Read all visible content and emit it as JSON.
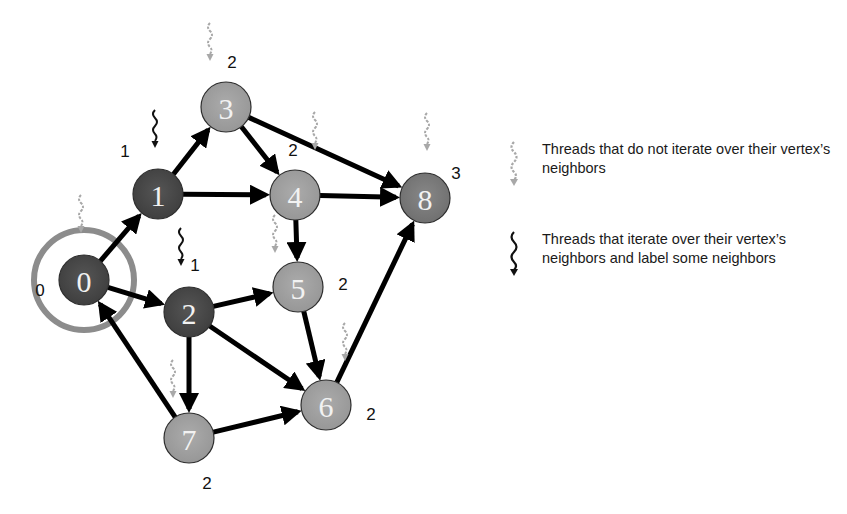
{
  "diagram": {
    "type": "directed-graph-bfs",
    "source_node": "0",
    "colors": {
      "visited_dark": "#4b4b4b",
      "frontier_light": "#a3a3a3",
      "node_8": "#7e7e7e",
      "source_ring": "#8c8c8c",
      "edge": "#000000",
      "idle_thread": "#a8a8a8",
      "active_thread": "#111111"
    },
    "nodes": [
      {
        "id": "0",
        "label": "0",
        "level": "0",
        "x": 84,
        "y": 280,
        "shade": "dark",
        "thread": "idle",
        "level_x": 40,
        "level_y": 290,
        "thread_x": 76,
        "thread_y": 195
      },
      {
        "id": "1",
        "label": "1",
        "level": "1",
        "x": 158,
        "y": 194,
        "shade": "dark",
        "thread": "active",
        "level_x": 125,
        "level_y": 151,
        "thread_x": 150,
        "thread_y": 110
      },
      {
        "id": "2",
        "label": "2",
        "level": "1",
        "x": 189,
        "y": 312,
        "shade": "dark",
        "thread": "active",
        "level_x": 195,
        "level_y": 265,
        "thread_x": 176,
        "thread_y": 228
      },
      {
        "id": "3",
        "label": "3",
        "level": "2",
        "x": 226,
        "y": 107,
        "shade": "light",
        "thread": "idle",
        "level_x": 232,
        "level_y": 62,
        "thread_x": 205,
        "thread_y": 23
      },
      {
        "id": "4",
        "label": "4",
        "level": "2",
        "x": 295,
        "y": 195,
        "shade": "light",
        "thread": "idle",
        "level_x": 293,
        "level_y": 150,
        "thread_x": 310,
        "thread_y": 112
      },
      {
        "id": "5",
        "label": "5",
        "level": "2",
        "x": 298,
        "y": 287,
        "shade": "light",
        "thread": "idle",
        "level_x": 343,
        "level_y": 284,
        "thread_x": 270,
        "thread_y": 215
      },
      {
        "id": "6",
        "label": "6",
        "level": "2",
        "x": 326,
        "y": 405,
        "shade": "light",
        "thread": "idle",
        "level_x": 371,
        "level_y": 414,
        "thread_x": 340,
        "thread_y": 323
      },
      {
        "id": "7",
        "label": "7",
        "level": "2",
        "x": 189,
        "y": 438,
        "shade": "light",
        "thread": "idle",
        "level_x": 207,
        "level_y": 483,
        "thread_x": 168,
        "thread_y": 360
      },
      {
        "id": "8",
        "label": "8",
        "level": "3",
        "x": 425,
        "y": 198,
        "shade": "mid",
        "thread": "idle",
        "level_x": 456,
        "level_y": 173,
        "thread_x": 422,
        "thread_y": 113
      }
    ],
    "edges": [
      {
        "from": "0",
        "to": "1"
      },
      {
        "from": "0",
        "to": "2"
      },
      {
        "from": "1",
        "to": "3"
      },
      {
        "from": "1",
        "to": "4"
      },
      {
        "from": "3",
        "to": "4"
      },
      {
        "from": "3",
        "to": "8"
      },
      {
        "from": "4",
        "to": "8"
      },
      {
        "from": "4",
        "to": "5"
      },
      {
        "from": "2",
        "to": "5"
      },
      {
        "from": "2",
        "to": "6"
      },
      {
        "from": "2",
        "to": "7"
      },
      {
        "from": "5",
        "to": "6"
      },
      {
        "from": "7",
        "to": "6"
      },
      {
        "from": "7",
        "to": "0"
      },
      {
        "from": "6",
        "to": "8"
      }
    ]
  },
  "legend": {
    "items": [
      {
        "icon": "idle-thread-icon",
        "text": "Threads that do not iterate over their vertex’s neighbors"
      },
      {
        "icon": "active-thread-icon",
        "text": "Threads that iterate over their vertex’s neighbors and label some neighbors"
      }
    ]
  }
}
